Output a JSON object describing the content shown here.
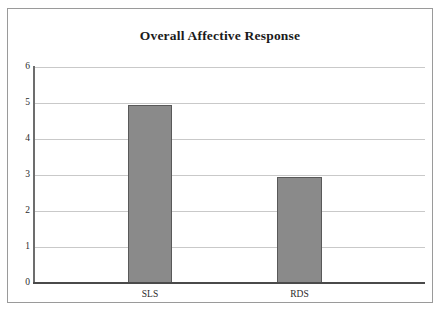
{
  "chart_data": {
    "type": "bar",
    "title": "Overall Affective Response",
    "xlabel": "",
    "ylabel": "",
    "categories": [
      "SLS",
      "RDS"
    ],
    "values": [
      4.95,
      2.95
    ],
    "series": [
      {
        "name": "Overall Affective Response",
        "values": [
          4.95,
          2.95
        ]
      }
    ],
    "ylim": [
      0,
      6
    ],
    "y_ticks": [
      "6",
      "5",
      "4",
      "3",
      "2",
      "1",
      "0"
    ],
    "y_tick_values": [
      6,
      5,
      4,
      3,
      2,
      1,
      0
    ],
    "grid": true,
    "legend": false,
    "legend_position": "none",
    "bar_color": "#8a8a8a",
    "bar_border_color": "#595959",
    "gridline_color": "#c9c9c9",
    "axis_color": "#4a4a4a",
    "frame_border_color": "#9a9a9a",
    "background_color": "#ffffff"
  }
}
